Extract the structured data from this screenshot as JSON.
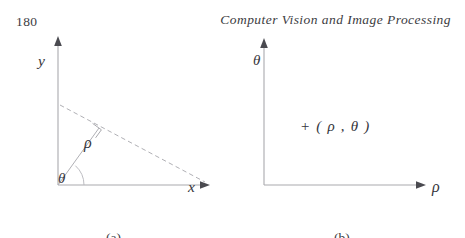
{
  "page": {
    "folio": "180",
    "running_title": "Computer Vision and Image Processing",
    "width": 465,
    "height": 238,
    "background": "#ffffff",
    "ink_color": "#34343a",
    "line_color": "#a9a9ae"
  },
  "figure": {
    "panels": [
      {
        "id": "a",
        "caption": "(a)",
        "axes": {
          "vertical_label": "y",
          "horizontal_label": "x"
        },
        "annotations": [
          {
            "name": "rho",
            "label": "ρ"
          },
          {
            "name": "theta",
            "label": "θ"
          }
        ],
        "elements": [
          "y-axis-arrow",
          "x-axis-arrow",
          "dashed-line",
          "rho-segment",
          "right-angle-marker",
          "theta-arc"
        ]
      },
      {
        "id": "b",
        "caption": "(b)",
        "axes": {
          "vertical_label": "θ",
          "horizontal_label": "ρ"
        },
        "annotations": [
          {
            "name": "point-marker",
            "label": "+ ( ρ , θ )"
          }
        ],
        "elements": [
          "theta-axis-arrow",
          "rho-axis-arrow",
          "point-plus-marker"
        ]
      }
    ]
  }
}
